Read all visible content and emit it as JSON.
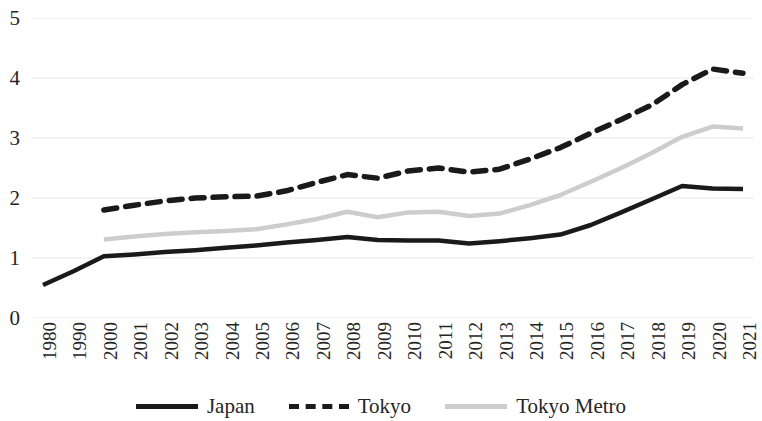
{
  "chart_data": {
    "type": "line",
    "title": "",
    "xlabel": "",
    "ylabel": "",
    "ylim": [
      0,
      5
    ],
    "y_ticks": [
      0,
      1,
      2,
      3,
      4,
      5
    ],
    "grid": true,
    "legend_position": "bottom",
    "categories": [
      "1980",
      "1990",
      "2000",
      "2001",
      "2002",
      "2003",
      "2004",
      "2005",
      "2006",
      "2007",
      "2008",
      "2009",
      "2010",
      "2011",
      "2012",
      "2013",
      "2014",
      "2015",
      "2016",
      "2017",
      "2018",
      "2019",
      "2020",
      "2021"
    ],
    "series": [
      {
        "name": "Japan",
        "style": "solid",
        "color": "#1a1a1a",
        "values": [
          0.55,
          0.78,
          1.03,
          1.06,
          1.1,
          1.13,
          1.17,
          1.21,
          1.26,
          1.3,
          1.35,
          1.3,
          1.29,
          1.29,
          1.24,
          1.28,
          1.33,
          1.39,
          1.55,
          1.76,
          1.98,
          2.2,
          2.16,
          2.15
        ]
      },
      {
        "name": "Tokyo",
        "style": "dashed",
        "color": "#1a1a1a",
        "values": [
          null,
          null,
          1.8,
          1.88,
          1.95,
          2.0,
          2.02,
          2.03,
          2.12,
          2.26,
          2.39,
          2.33,
          2.45,
          2.5,
          2.43,
          2.48,
          2.65,
          2.84,
          3.08,
          3.31,
          3.55,
          3.89,
          4.15,
          4.08
        ]
      },
      {
        "name": "Tokyo Metro",
        "style": "solid",
        "color": "#cdcdcd",
        "values": [
          null,
          null,
          1.31,
          1.36,
          1.4,
          1.43,
          1.45,
          1.48,
          1.56,
          1.65,
          1.77,
          1.68,
          1.76,
          1.77,
          1.7,
          1.74,
          1.88,
          2.05,
          2.27,
          2.5,
          2.75,
          3.02,
          3.19,
          3.16
        ]
      }
    ]
  },
  "legend": {
    "items": [
      {
        "label": "Japan",
        "swatch": "solid-dark"
      },
      {
        "label": "Tokyo",
        "swatch": "dashed-dark"
      },
      {
        "label": "Tokyo Metro",
        "swatch": "solid-gray"
      }
    ]
  }
}
